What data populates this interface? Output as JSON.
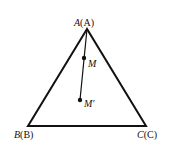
{
  "diagram": {
    "type": "triangle",
    "vertices": [
      {
        "id": "A",
        "label_italic": "A",
        "label_paren": "(A)",
        "x": 87,
        "y": 29
      },
      {
        "id": "B",
        "label_italic": "B",
        "label_paren": "(B)",
        "x": 28,
        "y": 126
      },
      {
        "id": "C",
        "label_italic": "C",
        "label_paren": "(C)",
        "x": 146,
        "y": 126
      }
    ],
    "points": [
      {
        "id": "M",
        "label": "M",
        "x": 84,
        "y": 58
      },
      {
        "id": "M'",
        "label": "M'",
        "x": 80,
        "y": 100
      }
    ],
    "segments": [
      [
        "A",
        "M'"
      ]
    ],
    "colors": {
      "stroke": "#111111",
      "background": "#ffffff"
    }
  }
}
